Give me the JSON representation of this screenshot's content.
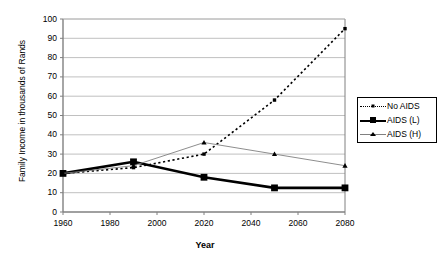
{
  "chart_data": {
    "type": "line",
    "title": "",
    "xlabel": "Year",
    "ylabel": "Family Income in thousands of Rands",
    "x": [
      1960,
      1990,
      2020,
      2050,
      2080
    ],
    "xlim": [
      1960,
      2080
    ],
    "ylim": [
      0,
      100
    ],
    "ytick_labels": [
      "0",
      "10",
      "20",
      "30",
      "40",
      "50",
      "60",
      "70",
      "80",
      "90",
      "100"
    ],
    "ytick_values": [
      0,
      10,
      20,
      30,
      40,
      50,
      60,
      70,
      80,
      90,
      100
    ],
    "xtick_labels": [
      "1960",
      "1980",
      "2000",
      "2020",
      "2040",
      "2060",
      "2080"
    ],
    "xtick_values": [
      1960,
      1980,
      2000,
      2020,
      2040,
      2060,
      2080
    ],
    "grid": "horizontal",
    "legend_position": "right",
    "series": [
      {
        "name": "No AIDS",
        "values": [
          20,
          23,
          30,
          58,
          95
        ],
        "color": "#000000",
        "style": "dotted",
        "marker": "square-small",
        "width": 1.6
      },
      {
        "name": "AIDS (L)",
        "values": [
          20,
          26,
          18,
          12.5,
          12.5
        ],
        "color": "#000000",
        "style": "solid",
        "marker": "square-large",
        "width": 2.6
      },
      {
        "name": "AIDS (H)",
        "values": [
          20,
          24,
          36,
          30,
          24
        ],
        "color": "#808080",
        "style": "solid",
        "marker": "triangle",
        "width": 0.9
      }
    ]
  },
  "plot": {
    "left": 63,
    "right": 345,
    "top": 19,
    "bottom": 212,
    "axis_color": "#808080",
    "grid_color": "#b0b0b0",
    "background": "#ffffff"
  },
  "legend": {
    "items": [
      "No AIDS",
      "AIDS (L)",
      "AIDS (H)"
    ]
  }
}
